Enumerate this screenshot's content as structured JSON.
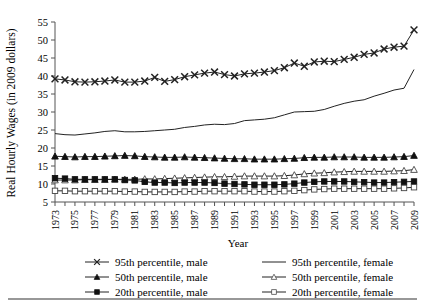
{
  "chart_data": {
    "type": "line",
    "title": "",
    "xlabel": "Year",
    "ylabel": "Real Hourly Wages (in 2009 dollars)",
    "xlim": [
      1973,
      2009
    ],
    "ylim": [
      5,
      55
    ],
    "ytick_labels": [
      "5",
      "10",
      "15",
      "20",
      "25",
      "30",
      "35",
      "40",
      "45",
      "50",
      "55"
    ],
    "ytick_values": [
      5,
      10,
      15,
      20,
      25,
      30,
      35,
      40,
      45,
      50,
      55
    ],
    "xtick_labels": [
      "1973",
      "1975",
      "1977",
      "1979",
      "1981",
      "1983",
      "1985",
      "1987",
      "1989",
      "1991",
      "1993",
      "1995",
      "1997",
      "1999",
      "2001",
      "2003",
      "2005",
      "2007",
      "2009"
    ],
    "xtick_values": [
      1973,
      1975,
      1977,
      1979,
      1981,
      1983,
      1985,
      1987,
      1989,
      1991,
      1993,
      1995,
      1997,
      1999,
      2001,
      2003,
      2005,
      2007,
      2009
    ],
    "x": [
      1973,
      1974,
      1975,
      1976,
      1977,
      1978,
      1979,
      1980,
      1981,
      1982,
      1983,
      1984,
      1985,
      1986,
      1987,
      1988,
      1989,
      1990,
      1991,
      1992,
      1993,
      1994,
      1995,
      1996,
      1997,
      1998,
      1999,
      2000,
      2001,
      2002,
      2003,
      2004,
      2005,
      2006,
      2007,
      2008,
      2009
    ],
    "grid": false,
    "legend_position": "bottom",
    "series": [
      {
        "name": "95th percentile, male",
        "marker": "x-cross",
        "marker_filled": true,
        "color": "#222222",
        "values": [
          39.2,
          38.9,
          38.4,
          38.3,
          38.4,
          38.6,
          38.9,
          38.3,
          38.3,
          38.6,
          39.6,
          38.5,
          39.0,
          39.8,
          40.3,
          40.8,
          41.1,
          40.4,
          40.0,
          40.6,
          40.8,
          41.1,
          41.5,
          42.3,
          43.6,
          42.7,
          43.9,
          44.1,
          44.0,
          44.6,
          45.2,
          46.0,
          46.4,
          47.5,
          48.0,
          48.3,
          52.8
        ]
      },
      {
        "name": "95th percentile, female",
        "marker": "none",
        "marker_filled": false,
        "color": "#222222",
        "values": [
          24.0,
          23.7,
          23.6,
          23.9,
          24.2,
          24.6,
          24.8,
          24.5,
          24.5,
          24.6,
          24.8,
          25.0,
          25.2,
          25.7,
          26.0,
          26.4,
          26.6,
          26.5,
          26.8,
          27.6,
          27.8,
          28.0,
          28.4,
          29.2,
          30.0,
          30.1,
          30.2,
          30.7,
          31.6,
          32.4,
          33.0,
          33.4,
          34.4,
          35.2,
          36.1,
          36.6,
          41.8
        ]
      },
      {
        "name": "50th percentile, male",
        "marker": "triangle",
        "marker_filled": true,
        "color": "#111111",
        "values": [
          17.7,
          17.6,
          17.5,
          17.6,
          17.6,
          17.7,
          17.8,
          17.9,
          17.8,
          17.6,
          17.5,
          17.4,
          17.4,
          17.5,
          17.4,
          17.3,
          17.2,
          17.1,
          17.0,
          17.0,
          16.9,
          16.9,
          16.9,
          17.0,
          17.1,
          17.3,
          17.4,
          17.4,
          17.5,
          17.5,
          17.5,
          17.4,
          17.4,
          17.4,
          17.5,
          17.6,
          17.9
        ]
      },
      {
        "name": "50th percentile, female",
        "marker": "triangle",
        "marker_filled": false,
        "color": "#444444",
        "values": [
          11.1,
          11.1,
          11.1,
          11.2,
          11.2,
          11.2,
          11.3,
          11.3,
          11.3,
          11.4,
          11.4,
          11.5,
          11.6,
          11.7,
          11.8,
          11.9,
          12.0,
          12.0,
          12.1,
          12.2,
          12.2,
          12.2,
          12.2,
          12.3,
          12.5,
          12.8,
          13.0,
          13.1,
          13.3,
          13.4,
          13.5,
          13.5,
          13.5,
          13.5,
          13.6,
          13.7,
          14.0
        ]
      },
      {
        "name": "20th percentile, male",
        "marker": "square",
        "marker_filled": true,
        "color": "#111111",
        "values": [
          11.6,
          11.5,
          11.3,
          11.3,
          11.3,
          11.3,
          11.3,
          11.1,
          11.0,
          10.6,
          10.4,
          10.4,
          10.3,
          10.4,
          10.4,
          10.4,
          10.3,
          10.1,
          10.0,
          9.9,
          9.8,
          9.8,
          9.8,
          9.9,
          10.1,
          10.4,
          10.6,
          10.7,
          10.7,
          10.7,
          10.6,
          10.5,
          10.4,
          10.4,
          10.5,
          10.6,
          10.7
        ]
      },
      {
        "name": "20th percentile, female",
        "marker": "square",
        "marker_filled": false,
        "color": "#444444",
        "values": [
          8.1,
          8.1,
          8.0,
          8.0,
          8.0,
          8.0,
          8.0,
          7.9,
          7.9,
          7.8,
          7.8,
          7.8,
          7.8,
          7.9,
          7.9,
          8.0,
          8.0,
          8.0,
          8.0,
          8.0,
          7.9,
          7.9,
          7.9,
          8.0,
          8.1,
          8.3,
          8.5,
          8.6,
          8.7,
          8.7,
          8.7,
          8.7,
          8.7,
          8.7,
          8.8,
          8.9,
          9.1
        ]
      }
    ]
  },
  "legend": {
    "items": [
      {
        "label": "95th percentile, male",
        "series_index": 0
      },
      {
        "label": "95th percentile, female",
        "series_index": 1
      },
      {
        "label": "50th percentile, male",
        "series_index": 2
      },
      {
        "label": "50th percentile, female",
        "series_index": 3
      },
      {
        "label": "20th percentile, male",
        "series_index": 4
      },
      {
        "label": "20th percentile, female",
        "series_index": 5
      }
    ]
  }
}
